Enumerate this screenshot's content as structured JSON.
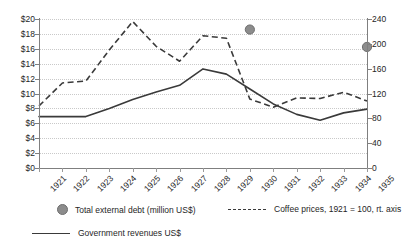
{
  "chart_data": {
    "type": "line",
    "title": "",
    "xlabel": "",
    "ylabel": "",
    "grid": true,
    "legend_position": "bottom",
    "x": [
      1921,
      1922,
      1923,
      1924,
      1925,
      1926,
      1927,
      1928,
      1929,
      1930,
      1931,
      1932,
      1933,
      1934,
      1935
    ],
    "categories": [
      "1921",
      "1922",
      "1923",
      "1924",
      "1925",
      "1926",
      "1927",
      "1928",
      "1929",
      "1930",
      "1931",
      "1932",
      "1933",
      "1934",
      "1935"
    ],
    "axes": {
      "left": {
        "label": "",
        "ylim": [
          0,
          20
        ],
        "ticks": [
          0,
          2,
          4,
          6,
          8,
          10,
          12,
          14,
          16,
          18,
          20
        ],
        "tick_labels": [
          "$0",
          "$2",
          "$4",
          "$6",
          "$8",
          "$10",
          "$12",
          "$14",
          "$16",
          "$18",
          "$20"
        ]
      },
      "right": {
        "label": "",
        "ylim": [
          0,
          240
        ],
        "ticks": [
          0,
          40,
          80,
          120,
          160,
          200,
          240
        ],
        "tick_labels": [
          "0",
          "40",
          "80",
          "120",
          "160",
          "200",
          "240"
        ]
      }
    },
    "series": [
      {
        "name": "Government revenues US$",
        "axis": "left",
        "style": "solid",
        "color": "#3a3a3a",
        "values": [
          6.9,
          6.9,
          6.9,
          8.0,
          9.2,
          10.2,
          11.1,
          13.3,
          12.6,
          10.6,
          8.6,
          7.2,
          6.4,
          7.4,
          7.9
        ]
      },
      {
        "name": "Coffee prices, 1921 = 100, rt. axis",
        "axis": "right",
        "style": "dashed",
        "color": "#3a3a3a",
        "values": [
          100,
          137,
          140,
          190,
          236,
          196,
          172,
          213,
          209,
          111,
          98,
          113,
          112,
          122,
          108
        ]
      },
      {
        "name": "Total external debt (million US$)",
        "axis": "right",
        "style": "marker",
        "color": "#8c8c8c",
        "points": [
          {
            "x": 1930,
            "y": 223
          },
          {
            "x": 1935,
            "y": 195
          }
        ]
      }
    ]
  },
  "legend": {
    "items": [
      {
        "label": "Total external debt (million US$)",
        "marker": "dot"
      },
      {
        "label": "Coffee prices, 1921 = 100, rt. axis",
        "marker": "dashed-line"
      },
      {
        "label": "Government revenues US$",
        "marker": "solid-line"
      }
    ]
  },
  "colors": {
    "line": "#3a3a3a",
    "marker": "#8c8c8c",
    "axis": "#7f7f7f",
    "grid": "#c9c9c9",
    "text": "#262626",
    "background": "#ffffff"
  }
}
